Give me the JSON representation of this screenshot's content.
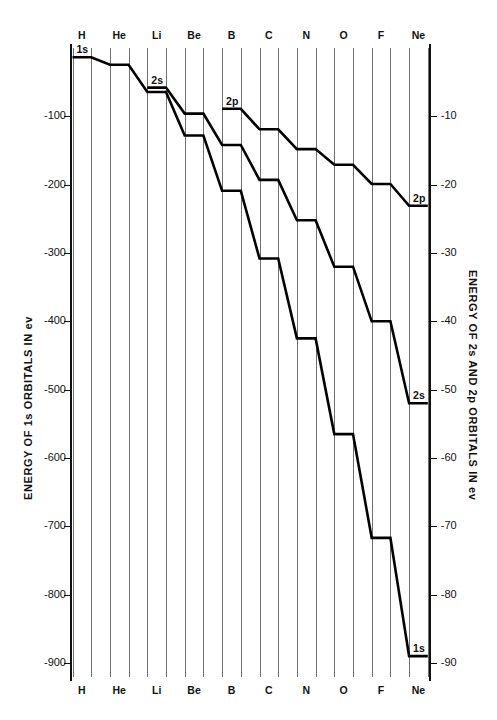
{
  "chart_data": {
    "type": "line",
    "title": "",
    "categories": [
      "H",
      "He",
      "Li",
      "Be",
      "B",
      "C",
      "N",
      "O",
      "F",
      "Ne"
    ],
    "xlabel": "",
    "left_axis": {
      "label": "ENERGY OF 1s ORBITALS IN ev",
      "ticks": [
        -100,
        -200,
        -300,
        -400,
        -500,
        -600,
        -700,
        -800,
        -900
      ],
      "tick_labels": [
        "-100",
        "-200",
        "-300",
        "-400",
        "-500",
        "-600",
        "-700",
        "-800",
        "-900"
      ],
      "range": [
        -920,
        12
      ]
    },
    "right_axis": {
      "label": "ENERGY OF 2s AND 2p ORBITALS IN ev",
      "ticks": [
        -10,
        -20,
        -30,
        -40,
        -50,
        -60,
        -70,
        -80,
        -90
      ],
      "tick_labels": [
        "-10",
        "-20",
        "-30",
        "-40",
        "-50",
        "-60",
        "-70",
        "-80",
        "-90"
      ],
      "range": [
        -92,
        1.2
      ]
    },
    "grid": true,
    "legend": "inline-series-labels",
    "series": [
      {
        "name": "1s",
        "axis": "left",
        "unit": "ev",
        "values": [
          -13.6,
          -24.6,
          -64.4,
          -128.0,
          -209.0,
          -308.0,
          -425.0,
          -565.0,
          -717.0,
          -890.0
        ]
      },
      {
        "name": "2s",
        "axis": "right",
        "unit": "ev",
        "values": [
          null,
          null,
          -5.8,
          -9.6,
          -14.2,
          -19.3,
          -25.2,
          -32.0,
          -40.0,
          -52.0
        ]
      },
      {
        "name": "2p",
        "axis": "right",
        "unit": "ev",
        "values": [
          null,
          null,
          null,
          null,
          -8.9,
          -11.9,
          -14.8,
          -17.1,
          -19.9,
          -23.1
        ]
      }
    ],
    "annotations": [
      {
        "text": "1s",
        "series": "1s",
        "at": "H"
      },
      {
        "text": "2s",
        "series": "2s",
        "at": "Li"
      },
      {
        "text": "2p",
        "series": "2p",
        "at": "B"
      },
      {
        "text": "2p",
        "series": "2p",
        "at": "Ne"
      },
      {
        "text": "2s",
        "series": "2s",
        "at": "Ne"
      },
      {
        "text": "1s",
        "series": "1s",
        "at": "Ne"
      }
    ]
  }
}
